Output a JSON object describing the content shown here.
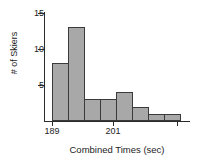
{
  "chart_data": {
    "type": "bar",
    "title": "",
    "subtitle": "",
    "xlabel": "Combined Times (sec)",
    "ylabel": "# of Skiers",
    "categories": [
      "189-191",
      "191-193",
      "193-195",
      "195-197",
      "197-199",
      "199-201",
      "201-203",
      "203-205"
    ],
    "values": [
      8,
      13,
      3,
      3,
      4,
      2,
      1,
      1
    ],
    "bin_edges": [
      189,
      191,
      193,
      195,
      197,
      199,
      201,
      203,
      205
    ],
    "bin_width": 2,
    "x_tick_labels": [
      "189",
      "201"
    ],
    "x_tick_values": [
      189,
      201
    ],
    "y_tick_labels": [
      "5",
      "10",
      "15"
    ],
    "y_tick_values": [
      5,
      10,
      15
    ],
    "ylim": [
      0,
      16
    ],
    "xlim": [
      188,
      208
    ],
    "grid": false,
    "legend": false,
    "legend_position": "none",
    "bar_fill_color": "#a8a8a8",
    "bar_edge_color": "#3a3a3a",
    "axis_color": "#2b2b2b",
    "background_color": "#ffffff"
  },
  "figure": {
    "width": 201,
    "height": 164
  }
}
